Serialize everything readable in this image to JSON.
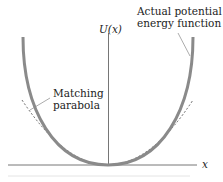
{
  "diagram": {
    "type": "potential-energy-plot",
    "axes": {
      "y_label": "U(x)",
      "x_label": "x"
    },
    "curves": [
      {
        "name": "Actual potential energy function",
        "style": "solid",
        "color": "#8a8a8a"
      },
      {
        "name": "Matching parabola",
        "style": "dashed",
        "color": "#555555"
      }
    ],
    "annotations": {
      "actual_line1": "Actual potential",
      "actual_line2": "energy function",
      "parabola_line1": "Matching",
      "parabola_line2": "parabola"
    }
  }
}
